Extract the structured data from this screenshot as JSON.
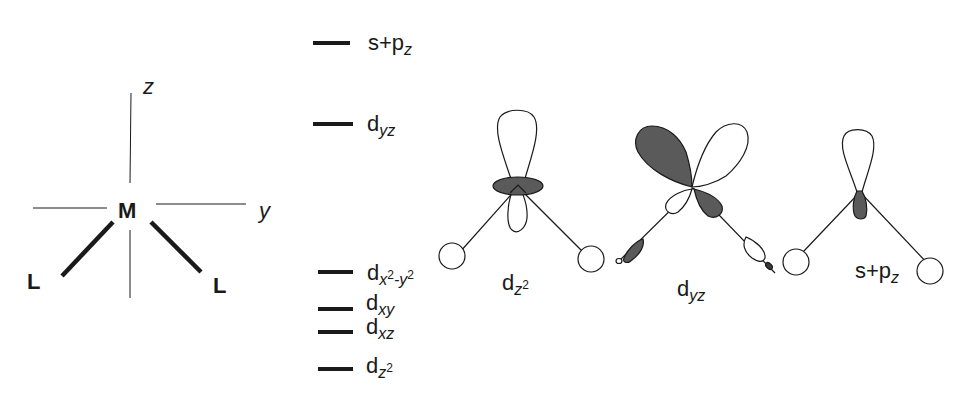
{
  "coordinate_frame": {
    "axis_z": "z",
    "axis_y": "y",
    "metal": "M",
    "ligand_left": "L",
    "ligand_right": "L"
  },
  "energy_levels": [
    {
      "base": "s+p",
      "sub": "z",
      "sup": "",
      "y": 43
    },
    {
      "base": "d",
      "sub": "yz",
      "sup": "",
      "y": 124
    },
    {
      "base": "d",
      "sub": "x",
      "sup": "2",
      "sub2": "-y",
      "sup2": "2",
      "y": 272
    },
    {
      "base": "d",
      "sub": "xy",
      "sup": "",
      "y": 309
    },
    {
      "base": "d",
      "sub": "xz",
      "sup": "",
      "y": 332
    },
    {
      "base": "d",
      "sub": "z",
      "sup": "2",
      "y": 369
    }
  ],
  "orbital_diagrams": [
    {
      "id": "dz2",
      "label_base": "d",
      "label_sub": "z",
      "label_sup": "2"
    },
    {
      "id": "dyz",
      "label_base": "d",
      "label_sub": "yz",
      "label_sup": ""
    },
    {
      "id": "s-pz",
      "label_base": "s+p",
      "label_sub": "z",
      "label_sup": ""
    }
  ],
  "colors": {
    "line": "#1a1a1a",
    "shaded_lobe": "#5a5a5a",
    "open_lobe": "#ffffff"
  }
}
